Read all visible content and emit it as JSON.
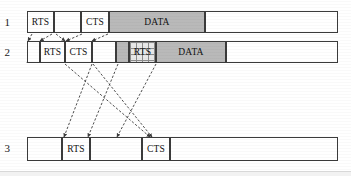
{
  "figure": {
    "colors": {
      "line": "#3b3b3b",
      "data_fill": "#b9b9b9",
      "hatch_fill": "#e8e8e8",
      "background": "#ffffff",
      "text": "#111111"
    }
  },
  "rows": [
    {
      "label": "1",
      "label_x": 10,
      "label_y": 17,
      "track": {
        "x": 27,
        "y": 11,
        "w": 311,
        "h": 22
      },
      "segments": [
        {
          "name": "rts",
          "text": "RTS",
          "x": 27,
          "y": 11,
          "w": 27,
          "h": 22,
          "fill": "white"
        },
        {
          "name": "gap",
          "text": "",
          "x": 54,
          "y": 11,
          "w": 27,
          "h": 22,
          "fill": "white"
        },
        {
          "name": "cts",
          "text": "CTS",
          "x": 81,
          "y": 11,
          "w": 28,
          "h": 22,
          "fill": "white"
        },
        {
          "name": "data",
          "text": "DATA",
          "x": 109,
          "y": 11,
          "w": 96,
          "h": 22,
          "fill": "gray"
        },
        {
          "name": "idle",
          "text": "",
          "x": 205,
          "y": 11,
          "w": 133,
          "h": 22,
          "fill": "white"
        }
      ]
    },
    {
      "label": "2",
      "label_x": 10,
      "label_y": 47,
      "track": {
        "x": 27,
        "y": 41,
        "w": 311,
        "h": 22
      },
      "segments": [
        {
          "name": "slot-a",
          "text": "",
          "x": 27,
          "y": 41,
          "w": 13,
          "h": 22,
          "fill": "white"
        },
        {
          "name": "rts",
          "text": "RTS",
          "x": 40,
          "y": 41,
          "w": 25,
          "h": 22,
          "fill": "white"
        },
        {
          "name": "cts",
          "text": "CTS",
          "x": 65,
          "y": 41,
          "w": 27,
          "h": 22,
          "fill": "white"
        },
        {
          "name": "slot-b",
          "text": "",
          "x": 92,
          "y": 41,
          "w": 24,
          "h": 22,
          "fill": "white"
        },
        {
          "name": "busy",
          "text": "",
          "x": 116,
          "y": 41,
          "w": 13,
          "h": 22,
          "fill": "gray"
        },
        {
          "name": "rts-coll",
          "text": "RTS",
          "x": 129,
          "y": 41,
          "w": 27,
          "h": 22,
          "fill": "hatch"
        },
        {
          "name": "data",
          "text": "DATA",
          "x": 156,
          "y": 41,
          "w": 70,
          "h": 22,
          "fill": "gray"
        },
        {
          "name": "idle",
          "text": "",
          "x": 226,
          "y": 41,
          "w": 112,
          "h": 22,
          "fill": "white"
        }
      ]
    },
    {
      "label": "3",
      "label_x": 10,
      "label_y": 143,
      "track": {
        "x": 27,
        "y": 137,
        "w": 311,
        "h": 24
      },
      "segments": [
        {
          "name": "idle-left",
          "text": "",
          "x": 27,
          "y": 137,
          "w": 35,
          "h": 24,
          "fill": "white"
        },
        {
          "name": "rts",
          "text": "RTS",
          "x": 62,
          "y": 137,
          "w": 28,
          "h": 24,
          "fill": "white"
        },
        {
          "name": "gap",
          "text": "",
          "x": 90,
          "y": 137,
          "w": 52,
          "h": 24,
          "fill": "white"
        },
        {
          "name": "cts",
          "text": "CTS",
          "x": 142,
          "y": 137,
          "w": 28,
          "h": 24,
          "fill": "white"
        },
        {
          "name": "idle-right",
          "text": "",
          "x": 170,
          "y": 137,
          "w": 168,
          "h": 24,
          "fill": "white"
        }
      ]
    }
  ],
  "arrows": [
    {
      "name": "r1-rts-to-r2-a",
      "x1": 32,
      "y1": 34,
      "x2": 28,
      "y2": 41
    },
    {
      "name": "r1-rts-to-r2-b",
      "x1": 52,
      "y1": 34,
      "x2": 40,
      "y2": 41
    },
    {
      "name": "r1-cts-to-r2-a",
      "x1": 56,
      "y1": 34,
      "x2": 65,
      "y2": 41
    },
    {
      "name": "r1-cts-to-r2-b",
      "x1": 82,
      "y1": 34,
      "x2": 66,
      "y2": 41
    },
    {
      "name": "r1-data-to-r2",
      "x1": 108,
      "y1": 34,
      "x2": 92,
      "y2": 41
    },
    {
      "name": "r2-rts-to-r3",
      "x1": 65,
      "y1": 64,
      "x2": 150,
      "y2": 137
    },
    {
      "name": "r2-cts-to-r3",
      "x1": 92,
      "y1": 64,
      "x2": 64,
      "y2": 137
    },
    {
      "name": "r2-busy-to-r3",
      "x1": 118,
      "y1": 64,
      "x2": 88,
      "y2": 137
    },
    {
      "name": "r2-rtsc-to-r3",
      "x1": 156,
      "y1": 64,
      "x2": 117,
      "y2": 137
    },
    {
      "name": "r2-slot-to-r3",
      "x1": 93,
      "y1": 64,
      "x2": 152,
      "y2": 137
    }
  ],
  "peaks": [
    {
      "name": "peak-r2-slot-a",
      "x1": 27,
      "y1": 63,
      "xm": 34,
      "ym": 41,
      "x2": 41,
      "y2": 63
    },
    {
      "name": "peak-r2-slot-b",
      "x1": 64,
      "y1": 63,
      "xm": 72,
      "ym": 41,
      "x2": 80,
      "y2": 63
    },
    {
      "name": "peak-r2-slot-c",
      "x1": 92,
      "y1": 63,
      "xm": 104,
      "ym": 41,
      "x2": 116,
      "y2": 63
    }
  ]
}
